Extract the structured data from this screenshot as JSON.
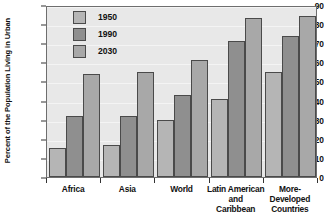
{
  "chart_data": {
    "type": "bar",
    "title": "",
    "xlabel": "",
    "ylabel": "Percent of the Population Living in Urban",
    "ylim": [
      0,
      90
    ],
    "ytick_step": 10,
    "yticks": [
      "0",
      "10",
      "20",
      "30",
      "40",
      "50",
      "60",
      "70",
      "80",
      "90"
    ],
    "grid": true,
    "legend_position": "top-left inside plot",
    "categories": [
      "Africa",
      "Asia",
      "World",
      "Latin American and Caribbean",
      "More-Developed Countries"
    ],
    "category_label_lines": [
      [
        "Africa"
      ],
      [
        "Asia"
      ],
      [
        "World"
      ],
      [
        "Latin American",
        "and",
        "Caribbean"
      ],
      [
        "More-",
        "Developed",
        "Countries"
      ]
    ],
    "series": [
      {
        "name": "1950",
        "color": "#b5b5b5",
        "values": [
          15,
          17,
          30,
          41,
          55
        ]
      },
      {
        "name": "1990",
        "color": "#8f8f8f",
        "values": [
          32,
          32,
          43,
          71,
          74
        ]
      },
      {
        "name": "2030",
        "color": "#a8a8a8",
        "values": [
          54,
          55,
          61,
          83,
          84
        ]
      }
    ]
  },
  "legend": {
    "items": [
      {
        "label": "1950",
        "color": "#b5b5b5"
      },
      {
        "label": "1990",
        "color": "#8f8f8f"
      },
      {
        "label": "2030",
        "color": "#a8a8a8"
      }
    ]
  },
  "colors": {
    "plot_background": "#e8e8e8",
    "figure_background": "#ffffff",
    "axis": "#6e6e6e",
    "bar_outline": "#4a4a4a",
    "gridline": "#f4f4f4",
    "text": "#111111"
  }
}
